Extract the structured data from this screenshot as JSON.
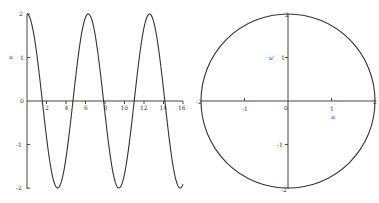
{
  "chart_data": [
    {
      "type": "line",
      "title": "",
      "xlabel": "",
      "ylabel": "u",
      "function": "u = 2 cos(t)",
      "xlim": [
        0,
        16
      ],
      "ylim": [
        -2,
        2
      ],
      "x_ticks": [
        "2",
        "4",
        "6",
        "8",
        "10",
        "12",
        "14",
        "16"
      ],
      "x_tick_values": [
        2,
        4,
        6,
        8,
        10,
        12,
        14,
        16
      ],
      "y_ticks": [
        "-2",
        "-1",
        "0",
        "1",
        "2"
      ],
      "y_tick_values": [
        -2,
        -1,
        0,
        1,
        2
      ],
      "grid": false,
      "series": [
        {
          "name": "u",
          "x": [
            0,
            1,
            1.5708,
            2,
            3,
            3.1416,
            4,
            4.7124,
            5,
            6,
            6.2832,
            7,
            7.854,
            8,
            9,
            9.4248,
            10,
            10.9956,
            11,
            12,
            12.5664,
            13,
            14,
            14.1372,
            15,
            15.708,
            16
          ],
          "y": [
            2,
            1.08,
            0,
            -0.83,
            -1.98,
            -2,
            -1.31,
            0,
            0.57,
            1.92,
            2,
            1.51,
            0,
            -0.29,
            -1.82,
            -2,
            -1.68,
            0,
            0.01,
            1.69,
            2,
            1.81,
            0.27,
            0,
            -1.52,
            -2,
            -1.92
          ]
        }
      ]
    },
    {
      "type": "line",
      "title": "",
      "xlabel": "u",
      "ylabel": "u'",
      "function": "phase portrait: u = 2 cos(t), u' = -2 sin(t) (circle radius 2)",
      "xlim": [
        -2,
        2
      ],
      "ylim": [
        -2,
        2
      ],
      "x_ticks": [
        "-2",
        "-1",
        "0",
        "1",
        "2"
      ],
      "x_tick_values": [
        -2,
        -1,
        0,
        1,
        2
      ],
      "y_ticks": [
        "-2",
        "-1",
        "1",
        "2"
      ],
      "y_tick_values": [
        -2,
        -1,
        1,
        2
      ],
      "grid": false,
      "series": [
        {
          "name": "trajectory",
          "x": [
            2,
            1.414,
            0,
            -1.414,
            -2,
            -1.414,
            0,
            1.414,
            2
          ],
          "y": [
            0,
            1.414,
            2,
            1.414,
            0,
            -1.414,
            -2,
            -1.414,
            0
          ]
        }
      ]
    }
  ],
  "left_plot": {
    "ylabel": "u",
    "origin_label": "0",
    "x_ticks": [
      "2",
      "4",
      "6",
      "8",
      "10",
      "12",
      "14",
      "16"
    ],
    "y_ticks": {
      "p2": "2",
      "p1": "1",
      "z": "0",
      "m1": "-1",
      "m2": "-2"
    }
  },
  "right_plot": {
    "xlabel": "u",
    "ylabel": "u'",
    "origin_label": "0",
    "x_ticks": {
      "m2": "-2",
      "m1": "-1",
      "p1": "1",
      "p2": "2"
    },
    "y_ticks": {
      "p2": "2",
      "p1": "1",
      "m1": "-1",
      "m2": "-2"
    }
  }
}
